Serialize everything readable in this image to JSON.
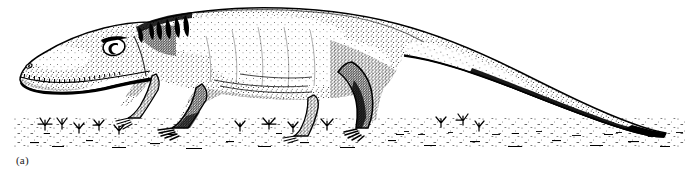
{
  "figure": {
    "panel_label": "(a)",
    "caption_text": "",
    "technique": "pen-and-ink-stipple",
    "orientation": "facing-left",
    "background_color": "#ffffff",
    "ink_color": "#000000",
    "label_color": "#1a1a1a",
    "width_px": 696,
    "height_px": 180
  },
  "anatomy": {
    "parts": [
      {
        "name": "head",
        "label": "head"
      },
      {
        "name": "snout",
        "label": "snout"
      },
      {
        "name": "eye",
        "label": "eye"
      },
      {
        "name": "nostril",
        "label": "nostril"
      },
      {
        "name": "upper-jaw-teeth",
        "label": "upper jaw teeth"
      },
      {
        "name": "lower-jaw",
        "label": "lower jaw"
      },
      {
        "name": "neck-crest",
        "label": "neck crest"
      },
      {
        "name": "dorsal-ridge",
        "label": "dorsal ridge"
      },
      {
        "name": "torso",
        "label": "torso"
      },
      {
        "name": "belly-shadow",
        "label": "belly shadow"
      },
      {
        "name": "forelimb-near",
        "label": "near forelimb"
      },
      {
        "name": "forelimb-far",
        "label": "far forelimb"
      },
      {
        "name": "hindlimb-near",
        "label": "near hindlimb"
      },
      {
        "name": "hindlimb-far",
        "label": "far hindlimb"
      },
      {
        "name": "tail",
        "label": "tail"
      },
      {
        "name": "tail-tip",
        "label": "tail tip"
      }
    ]
  },
  "scene": {
    "ground_line": "sparse stippled ground",
    "vegetation": [
      {
        "name": "grass-tuft",
        "x": 45,
        "y": 128
      },
      {
        "name": "grass-tuft",
        "x": 62,
        "y": 126
      },
      {
        "name": "grass-tuft",
        "x": 78,
        "y": 131
      },
      {
        "name": "grass-tuft",
        "x": 98,
        "y": 129
      },
      {
        "name": "grass-tuft",
        "x": 118,
        "y": 133
      },
      {
        "name": "grass-tuft",
        "x": 238,
        "y": 130
      },
      {
        "name": "grass-tuft",
        "x": 268,
        "y": 128
      },
      {
        "name": "grass-tuft",
        "x": 292,
        "y": 131
      },
      {
        "name": "grass-tuft",
        "x": 326,
        "y": 129
      },
      {
        "name": "grass-tuft",
        "x": 440,
        "y": 126
      },
      {
        "name": "grass-tuft",
        "x": 462,
        "y": 124
      },
      {
        "name": "grass-tuft",
        "x": 478,
        "y": 130
      }
    ]
  }
}
